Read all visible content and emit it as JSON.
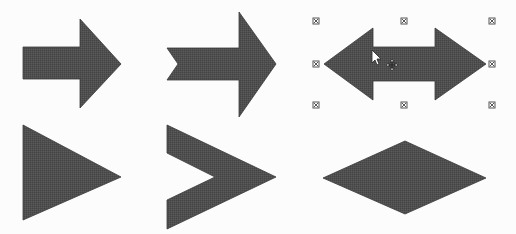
{
  "canvas": {
    "width": 516,
    "height": 234,
    "background": "#fcfcfc"
  },
  "colors": {
    "shape_fill": "#4d4d4d",
    "shape_stroke": "#3a3a3a",
    "handle": "#555555"
  },
  "shapes": [
    {
      "name": "right-arrow",
      "points": "23,47 80,47 80,19 121,64 80,108 80,79 23,79",
      "selected": false
    },
    {
      "name": "notched-right-arrow",
      "points": "167,48 239,48 239,12 276,64 239,117 239,80 167,80 178,64",
      "selected": false
    },
    {
      "name": "left-right-arrow",
      "points": "324,64 373,28 373,47 435,47 435,28 486,64 435,100 435,81 373,81 373,100",
      "selected": true
    },
    {
      "name": "isosceles-triangle",
      "points": "23,125 121,177 23,220",
      "selected": false
    },
    {
      "name": "chevron",
      "points": "167,125 276,177 167,229 167,200 215,177 167,153",
      "selected": false
    },
    {
      "name": "diamond",
      "points": "323,178 405,141 486,178 405,214",
      "selected": false
    }
  ],
  "selection_handles": [
    {
      "name": "handle-top-left",
      "x": 316,
      "y": 21
    },
    {
      "name": "handle-top-center",
      "x": 404,
      "y": 21
    },
    {
      "name": "handle-top-right",
      "x": 492,
      "y": 21
    },
    {
      "name": "handle-middle-left",
      "x": 316,
      "y": 64
    },
    {
      "name": "handle-middle-right",
      "x": 492,
      "y": 64
    },
    {
      "name": "handle-bottom-left",
      "x": 316,
      "y": 105
    },
    {
      "name": "handle-bottom-center",
      "x": 404,
      "y": 105
    },
    {
      "name": "handle-bottom-right",
      "x": 492,
      "y": 105
    }
  ],
  "cursor": {
    "type": "move-cursor",
    "x": 372,
    "y": 50
  }
}
